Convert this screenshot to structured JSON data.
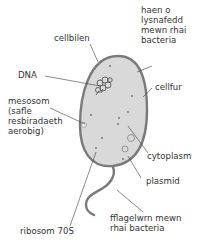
{
  "diagram": {
    "colors": {
      "cell_wall": "#7a7a7a",
      "cytoplasm": "#d9d9d9",
      "leader_line": "#3c3c3c",
      "dots": "#6a6a6a",
      "text": "#333333"
    },
    "labels": {
      "cellbilen": "cellbilen",
      "slime": "haen o\nlysnafedd\nmewn rhai\nbacteria",
      "dna": "DNA",
      "cellfur": "cellfur",
      "mesosom": "mesosom\n(safle\nresbiradaeth\naerobig)",
      "cytoplasm": "cytoplasm",
      "plasmid": "plasmid",
      "ribosom": "ribosom 70S",
      "flagellum": "fflagelwrn mewn\nrhai bacteria"
    }
  }
}
